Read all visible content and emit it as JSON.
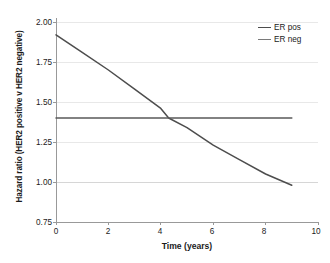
{
  "chart_data": {
    "type": "line",
    "title": "",
    "xlabel": "Time (years)",
    "ylabel": "Hazard ratio (HER2 positive v HER2 negative)",
    "xlim": [
      0,
      10
    ],
    "ylim": [
      0.75,
      2.0
    ],
    "xticks": [
      0,
      2,
      4,
      6,
      8,
      10
    ],
    "xtick_labels": [
      "0",
      "2",
      "4",
      "6",
      "8",
      "10"
    ],
    "yticks": [
      0.75,
      1.0,
      1.25,
      1.5,
      1.75,
      2.0
    ],
    "ytick_labels": [
      "0.75",
      "1.00",
      "1.25",
      "1.50",
      "1.75",
      "2.00"
    ],
    "grid": true,
    "grid_axis": "y",
    "legend_position": "top-right",
    "series": [
      {
        "name": "ER pos",
        "color": "#4d4d4d",
        "x": [
          0,
          1,
          2,
          3,
          4,
          4.3,
          5,
          6,
          7,
          8,
          9
        ],
        "values": [
          1.92,
          1.81,
          1.7,
          1.58,
          1.46,
          1.4,
          1.34,
          1.23,
          1.14,
          1.05,
          0.98
        ]
      },
      {
        "name": "ER neg",
        "color": "#595959",
        "x": [
          0,
          9
        ],
        "values": [
          1.4,
          1.4
        ]
      }
    ],
    "annotations": {
      "crossover_x": 4.3,
      "crossover_y": 1.4
    }
  },
  "legend": {
    "items": [
      {
        "label": "ER pos",
        "color": "#4d4d4d"
      },
      {
        "label": "ER neg",
        "color": "#7a7a7a"
      }
    ]
  },
  "colors": {
    "axis": "#999999",
    "gridline": "#e8e8e8",
    "gridline_strong": "#d6d6d6",
    "text": "#1b1b1b",
    "background": "#ffffff"
  }
}
